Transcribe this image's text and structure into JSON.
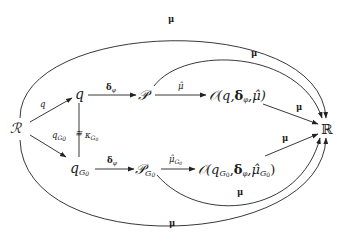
{
  "diagram": {
    "type": "commutative-diagram",
    "nodes": {
      "R_source": "ℛ",
      "q": "q",
      "q_G0": "q",
      "q_G0_sub": "G",
      "q_G0_subsub": "0",
      "P": "𝒫",
      "P_G0": "𝒫",
      "P_G0_sub": "G",
      "P_G0_subsub": "0",
      "O_top_open": "𝒪(q,",
      "O_top_delta": "δ",
      "O_top_delta_sub": "φ",
      "O_top_mu": ",μ̂)",
      "O_bot_open": "𝒪(q",
      "O_bot_sub": "G",
      "O_bot_subsub": "0",
      "O_bot_comma": ",",
      "O_bot_delta": "δ",
      "O_bot_delta_sub": "φ",
      "O_bot_mu": ",μ̂",
      "O_bot_mu_sub": "G",
      "O_bot_mu_subsub": "0",
      "O_bot_close": ")",
      "R_target": "ℝ"
    },
    "edges": {
      "R_to_q": "q",
      "R_to_qG0": "q",
      "R_to_qG0_sub": "G",
      "R_to_qG0_subsub": "0",
      "q_iso_qG0": "≅",
      "q_iso_qG0_label": "κ",
      "q_iso_qG0_sub": "G",
      "q_iso_qG0_subsub": "0",
      "q_to_P": "δ",
      "q_to_P_sub": "φ",
      "qG0_to_PG0": "δ",
      "qG0_to_PG0_sub": "φ",
      "P_to_O": "μ̂",
      "PG0_to_OG0": "μ̂",
      "PG0_to_OG0_sub": "G",
      "PG0_to_OG0_subsub": "0",
      "O_to_R": "μ",
      "OG0_to_R": "μ",
      "P_to_R_arc": "μ",
      "PG0_to_R_arc": "μ",
      "R_to_R_top_arc": "μ",
      "R_to_R_bottom_arc": "μ"
    }
  }
}
